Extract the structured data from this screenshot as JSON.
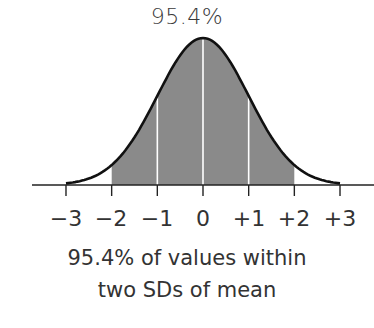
{
  "chart_data": {
    "type": "area",
    "title": "95.4%",
    "subtitle": "95.4% of values within two SDs of mean",
    "distribution": "normal",
    "xlabel": "",
    "ylabel": "",
    "x_ticks": [
      -3,
      -2,
      -1,
      0,
      1,
      2,
      3
    ],
    "x_tick_labels": [
      "−3",
      "−2",
      "−1",
      "0",
      "+1",
      "+2",
      "+3"
    ],
    "shaded_region": [
      -2,
      2
    ],
    "shaded_percent": 95.4,
    "internal_lines_at": [
      -1,
      0,
      1
    ],
    "xlim": [
      -3,
      3
    ],
    "grid": false,
    "legend": null
  },
  "header": {
    "percent_label": "95.4%"
  },
  "axis": {
    "ticks": [
      "−3",
      "−2",
      "−1",
      "0",
      "+1",
      "+2",
      "+3"
    ]
  },
  "caption": {
    "line1": "95.4% of values within",
    "line2": "two SDs of mean"
  },
  "colors": {
    "fill": "#8a8a8a",
    "curve": "#111111",
    "divider": "#ffffff",
    "axis": "#222222"
  }
}
